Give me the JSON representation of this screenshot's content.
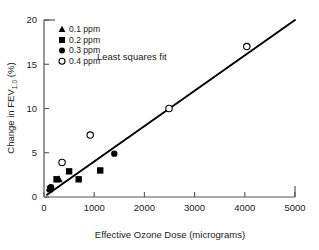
{
  "chart_data": {
    "type": "scatter",
    "title": "",
    "xlabel": "Effective Ozone Dose (micrograms)",
    "ylabel": "Change in FEV1.0 (%)",
    "ylabel_main": "Change in FEV",
    "ylabel_sub": "1.0",
    "ylabel_units": " (%)",
    "xlim": [
      0,
      5000
    ],
    "ylim": [
      0,
      20
    ],
    "xticks": [
      0,
      1000,
      2000,
      3000,
      4000,
      5000
    ],
    "yticks": [
      0,
      5,
      10,
      15,
      20
    ],
    "xtick_labels": [
      "0",
      "1000",
      "2000",
      "3000",
      "4000",
      "5000"
    ],
    "ytick_labels": [
      "0",
      "5",
      "10",
      "15",
      "20"
    ],
    "grid": false,
    "legend_position": "top-left",
    "annotations": [
      {
        "text": "Least squares fit",
        "x": 1750,
        "y": 15.5
      }
    ],
    "fit": {
      "label": "Least squares fit",
      "type": "line",
      "x": [
        60,
        5000
      ],
      "y": [
        0.25,
        20.0
      ]
    },
    "series": [
      {
        "name": "0.1 ppm",
        "marker": "triangle",
        "fill": "filled",
        "color": "#000000",
        "points": [
          {
            "x": 110,
            "y": 1.0
          },
          {
            "x": 300,
            "y": 2.0
          }
        ]
      },
      {
        "name": "0.2 ppm",
        "marker": "square",
        "fill": "filled",
        "color": "#000000",
        "points": [
          {
            "x": 120,
            "y": 0.9
          },
          {
            "x": 250,
            "y": 2.0
          },
          {
            "x": 500,
            "y": 2.9
          },
          {
            "x": 690,
            "y": 2.0
          },
          {
            "x": 1120,
            "y": 3.0
          }
        ]
      },
      {
        "name": "0.3 ppm",
        "marker": "circle",
        "fill": "filled",
        "color": "#000000",
        "points": [
          {
            "x": 140,
            "y": 1.1
          },
          {
            "x": 1400,
            "y": 4.9
          }
        ]
      },
      {
        "name": "0.4 ppm",
        "marker": "circle",
        "fill": "open",
        "color": "#000000",
        "points": [
          {
            "x": 360,
            "y": 3.9
          },
          {
            "x": 920,
            "y": 7.0
          },
          {
            "x": 2490,
            "y": 10.0
          },
          {
            "x": 4040,
            "y": 17.0
          }
        ]
      }
    ],
    "legend": [
      {
        "label": "0.1 ppm",
        "marker": "triangle",
        "fill": "filled"
      },
      {
        "label": "0.2 ppm",
        "marker": "square",
        "fill": "filled"
      },
      {
        "label": "0.3 ppm",
        "marker": "circle",
        "fill": "filled"
      },
      {
        "label": "0.4 ppm",
        "marker": "circle",
        "fill": "open"
      }
    ]
  }
}
